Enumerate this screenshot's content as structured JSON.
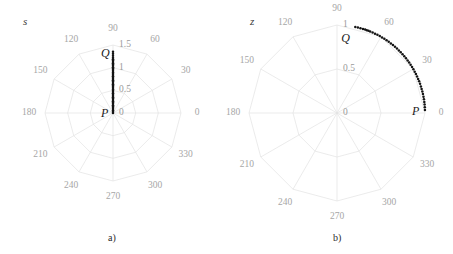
{
  "figure": {
    "width": 453,
    "height": 254,
    "background": "#ffffff",
    "grid_color": "#e3e3e3",
    "label_color": "#9a9a9a",
    "data_color": "#141414"
  },
  "panels": [
    {
      "id": "a",
      "caption": "a)",
      "variable_label": "s",
      "center": {
        "x": 113,
        "y": 113
      },
      "outer_radius": 68,
      "angle_labels": [
        "0",
        "30",
        "60",
        "90",
        "120",
        "150",
        "180",
        "210",
        "240",
        "270",
        "300",
        "330"
      ],
      "radial_labels": [
        "0",
        "0.5",
        "1",
        "1.5"
      ],
      "radial_values": [
        0,
        0.5,
        1,
        1.5
      ],
      "rings": [
        0.5,
        1,
        1.5
      ],
      "points": [
        {
          "name": "P",
          "label": "P",
          "r": 0,
          "theta_deg": 90
        },
        {
          "name": "Q",
          "label": "Q",
          "r": 1.35,
          "theta_deg": 90
        }
      ],
      "track": {
        "style": "dotted",
        "description": "straight radial dotted segment from P at r=0 to Q at r=1.35 along theta=90deg",
        "theta_deg": 90,
        "r_start": 0,
        "r_end": 1.35
      }
    },
    {
      "id": "b",
      "caption": "b)",
      "variable_label": "z",
      "center": {
        "x": 110,
        "y": 113
      },
      "outer_radius": 88,
      "angle_labels": [
        "0",
        "30",
        "60",
        "90",
        "120",
        "150",
        "180",
        "210",
        "240",
        "270",
        "300",
        "330"
      ],
      "radial_labels": [
        "0",
        "0.5",
        "1"
      ],
      "radial_values": [
        0,
        0.5,
        1
      ],
      "rings": [
        0.5,
        1
      ],
      "points": [
        {
          "name": "P",
          "label": "P",
          "r": 1.0,
          "theta_deg": 2
        },
        {
          "name": "Q",
          "label": "Q",
          "r": 1.0,
          "theta_deg": 78
        }
      ],
      "track": {
        "style": "dotted",
        "description": "dotted circular arc at r=1.0 sweeping from P at theta=2deg to Q at theta=78deg",
        "r": 1.0,
        "theta_start_deg": 2,
        "theta_end_deg": 78
      }
    }
  ],
  "chart_data": {
    "type": "scatter",
    "title": "",
    "subtitle": "",
    "projection": "polar",
    "panel_count": 2,
    "shared": {
      "angular_ticks_deg": [
        0,
        30,
        60,
        90,
        120,
        150,
        180,
        210,
        240,
        270,
        300,
        330
      ],
      "angular_tick_labels": [
        "0",
        "30",
        "60",
        "90",
        "120",
        "150",
        "180",
        "210",
        "240",
        "270",
        "300",
        "330"
      ],
      "grid": true,
      "legend": "none"
    },
    "panels": [
      {
        "id": "a",
        "caption": "a)",
        "axis_variable": "s",
        "radial_ticks": [
          0,
          0.5,
          1,
          1.5
        ],
        "radial_tick_labels": [
          "0",
          "0.5",
          "1",
          "1.5"
        ],
        "rlim": [
          0,
          1.5
        ],
        "series": [
          {
            "name": "s-trajectory",
            "style": "dotted",
            "color": "#141414",
            "theta_deg": [
              90,
              90,
              90,
              90,
              90,
              90,
              90,
              90,
              90,
              90,
              90,
              90,
              90,
              90
            ],
            "r": [
              0.0,
              0.1,
              0.2,
              0.3,
              0.4,
              0.5,
              0.6,
              0.7,
              0.8,
              0.9,
              1.0,
              1.1,
              1.2,
              1.35
            ]
          }
        ],
        "annotations": [
          {
            "text": "P",
            "theta_deg": 90,
            "r": 0.0
          },
          {
            "text": "Q",
            "theta_deg": 90,
            "r": 1.35
          }
        ]
      },
      {
        "id": "b",
        "caption": "b)",
        "axis_variable": "z",
        "radial_ticks": [
          0,
          0.5,
          1
        ],
        "radial_tick_labels": [
          "0",
          "0.5",
          "1"
        ],
        "rlim": [
          0,
          1.2
        ],
        "series": [
          {
            "name": "z-trajectory",
            "style": "dotted",
            "color": "#141414",
            "theta_deg": [
              2,
              8,
              14,
              20,
              26,
              32,
              38,
              44,
              50,
              56,
              62,
              68,
              72,
              78
            ],
            "r": [
              1.0,
              1.0,
              1.0,
              1.0,
              1.0,
              1.0,
              1.0,
              1.0,
              1.0,
              1.0,
              1.0,
              1.0,
              1.0,
              1.0
            ]
          }
        ],
        "annotations": [
          {
            "text": "P",
            "theta_deg": 2,
            "r": 1.0
          },
          {
            "text": "Q",
            "theta_deg": 78,
            "r": 1.0
          }
        ]
      }
    ]
  }
}
